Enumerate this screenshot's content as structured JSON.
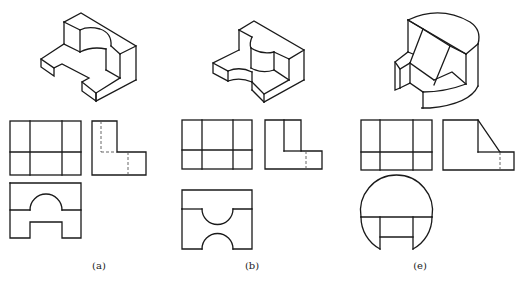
{
  "figure": {
    "panels": [
      {
        "id": "a",
        "caption": "(a)",
        "views": [
          "isometric",
          "front-view",
          "side-view",
          "top-view"
        ],
        "description": "Block with semicircular notch on top and rectangular slot on front"
      },
      {
        "id": "b",
        "caption": "(b)",
        "views": [
          "isometric",
          "front-view",
          "side-view",
          "top-view"
        ],
        "description": "Block with two opposing semicircular cutouts"
      },
      {
        "id": "e",
        "caption": "(e)",
        "views": [
          "isometric",
          "front-view",
          "side-view",
          "top-view"
        ],
        "description": "Cylinder with inclined cut and stepped slot"
      }
    ],
    "colors": {
      "line": "#1a1a1a",
      "hidden_line": "#555555",
      "background": "#ffffff"
    }
  }
}
